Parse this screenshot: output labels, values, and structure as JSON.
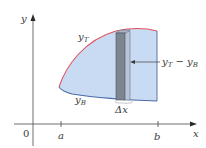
{
  "figure": {
    "type": "area-between-curves",
    "axes": {
      "x_label": "x",
      "y_label": "y",
      "origin_label": "0"
    },
    "ticks": [
      {
        "label": "a",
        "x": 61
      },
      {
        "label": "b",
        "x": 158
      }
    ],
    "curves": {
      "top": {
        "label": "y",
        "subscript": "T",
        "color": "#e0525e"
      },
      "bottom": {
        "label": "y",
        "subscript": "B",
        "color": "#4a6aa8"
      }
    },
    "region": {
      "fill_color": "#c9daf3"
    },
    "strip": {
      "width_label": "Δx",
      "height_label_parts": {
        "a": "y",
        "a_sub": "T",
        "minus": " − ",
        "b": "y",
        "b_sub": "B"
      },
      "front_color": "#7d8591",
      "side_color": "#b8c4d8"
    }
  }
}
